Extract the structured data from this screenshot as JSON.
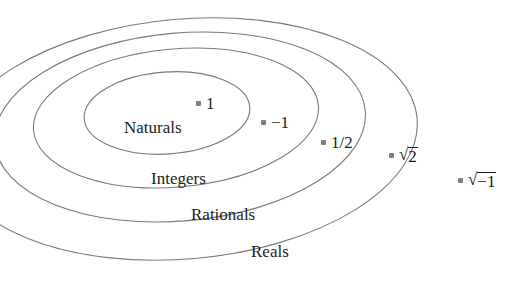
{
  "diagram": {
    "type": "nested-ellipses-venn",
    "background_color": "#ffffff",
    "stroke_color": "#7a7a7a",
    "text_color": "#1c1c1c",
    "marker_color": "#807f80",
    "sets": [
      {
        "name": "naturals",
        "label": "Naturals",
        "label_x": 124,
        "label_y": 119,
        "ellipse": {
          "cx": 167,
          "cy": 113,
          "rx": 83,
          "ry": 41,
          "rotation": -4
        }
      },
      {
        "name": "integers",
        "label": "Integers",
        "label_x": 151,
        "label_y": 170,
        "ellipse": {
          "cx": 176,
          "cy": 118,
          "rx": 143,
          "ry": 69,
          "rotation": -5
        }
      },
      {
        "name": "rationals",
        "label": "Rationals",
        "label_x": 191,
        "label_y": 206,
        "ellipse": {
          "cx": 180,
          "cy": 127,
          "rx": 186,
          "ry": 94,
          "rotation": -5
        }
      },
      {
        "name": "reals",
        "label": "Reals",
        "label_x": 251,
        "label_y": 243,
        "ellipse": {
          "cx": 184,
          "cy": 139,
          "rx": 234,
          "ry": 120,
          "rotation": -5
        }
      }
    ],
    "points": [
      {
        "name": "one",
        "label": "1",
        "label_kind": "plain",
        "x": 196,
        "y": 95,
        "member_of": "naturals"
      },
      {
        "name": "negative-one",
        "label": "−1",
        "label_kind": "plain",
        "x": 261,
        "y": 114,
        "member_of": "integers"
      },
      {
        "name": "one-half",
        "label": "1/2",
        "label_kind": "plain",
        "x": 321,
        "y": 134,
        "member_of": "rationals"
      },
      {
        "name": "square-root-of-two",
        "label": "√2",
        "label_kind": "radical",
        "radicand": "2",
        "x": 389,
        "y": 146,
        "member_of": "reals"
      },
      {
        "name": "square-root-of-negative-one",
        "label": "√−1",
        "label_kind": "radical",
        "radicand": "−1",
        "x": 458,
        "y": 171,
        "member_of": "outside"
      }
    ]
  }
}
